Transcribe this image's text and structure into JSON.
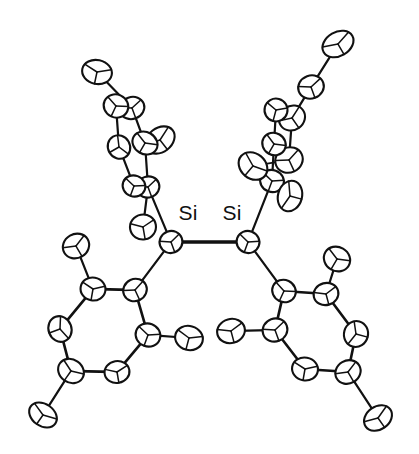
{
  "figure": {
    "kind": "ortep-thermal-ellipsoid-plot",
    "width": 419,
    "height": 454,
    "background_color": "#ffffff",
    "line_color": "#111111",
    "ellipsoid_fill": "#ffffff"
  },
  "labels": [
    {
      "name": "si1-label",
      "text": "Si",
      "x": 188,
      "y": 220,
      "anchor": "middle"
    },
    {
      "name": "si2-label",
      "text": "Si",
      "x": 232,
      "y": 220,
      "anchor": "middle"
    }
  ],
  "atoms": [
    {
      "id": "Si1",
      "element": "Si",
      "x": 171,
      "y": 242,
      "rx": 11.5,
      "ry": 11.0,
      "rot": -20
    },
    {
      "id": "Si2",
      "element": "Si",
      "x": 248,
      "y": 242,
      "rx": 11.5,
      "ry": 11.0,
      "rot": 20
    },
    {
      "id": "C11",
      "element": "C",
      "x": 135,
      "y": 290,
      "rx": 12.0,
      "ry": 11.0,
      "rot": -25
    },
    {
      "id": "C12",
      "element": "C",
      "x": 93,
      "y": 289,
      "rx": 12.5,
      "ry": 11.5,
      "rot": 10
    },
    {
      "id": "C13",
      "element": "C",
      "x": 60,
      "y": 329,
      "rx": 13.0,
      "ry": 11.5,
      "rot": 70
    },
    {
      "id": "C14",
      "element": "C",
      "x": 71,
      "y": 371,
      "rx": 13.5,
      "ry": 11.5,
      "rot": 35
    },
    {
      "id": "C15",
      "element": "C",
      "x": 117,
      "y": 372,
      "rx": 12.5,
      "ry": 11.0,
      "rot": -10
    },
    {
      "id": "C16",
      "element": "C",
      "x": 148,
      "y": 335,
      "rx": 12.5,
      "ry": 11.5,
      "rot": 20
    },
    {
      "id": "C17",
      "element": "C",
      "x": 76,
      "y": 246,
      "rx": 13.5,
      "ry": 12.0,
      "rot": -30
    },
    {
      "id": "C18",
      "element": "C",
      "x": 189,
      "y": 338,
      "rx": 14.0,
      "ry": 12.0,
      "rot": 15
    },
    {
      "id": "C19",
      "element": "C",
      "x": 43,
      "y": 415,
      "rx": 15.0,
      "ry": 11.0,
      "rot": 35
    },
    {
      "id": "C21",
      "element": "C",
      "x": 284,
      "y": 291,
      "rx": 12.0,
      "ry": 11.0,
      "rot": 25
    },
    {
      "id": "C22",
      "element": "C",
      "x": 326,
      "y": 294,
      "rx": 12.5,
      "ry": 11.0,
      "rot": -15
    },
    {
      "id": "C23",
      "element": "C",
      "x": 356,
      "y": 334,
      "rx": 13.0,
      "ry": 12.0,
      "rot": -75
    },
    {
      "id": "C24",
      "element": "C",
      "x": 348,
      "y": 372,
      "rx": 13.0,
      "ry": 11.5,
      "rot": -30
    },
    {
      "id": "C25",
      "element": "C",
      "x": 305,
      "y": 369,
      "rx": 13.0,
      "ry": 11.5,
      "rot": 10
    },
    {
      "id": "C26",
      "element": "C",
      "x": 275,
      "y": 330,
      "rx": 12.5,
      "ry": 11.5,
      "rot": -20
    },
    {
      "id": "C27",
      "element": "C",
      "x": 337,
      "y": 259,
      "rx": 13.5,
      "ry": 12.0,
      "rot": 30
    },
    {
      "id": "C28",
      "element": "C",
      "x": 231,
      "y": 331,
      "rx": 14.0,
      "ry": 12.0,
      "rot": -15
    },
    {
      "id": "C29",
      "element": "C",
      "x": 378,
      "y": 418,
      "rx": 15.0,
      "ry": 11.5,
      "rot": -35
    },
    {
      "id": "C31",
      "element": "C",
      "x": 148,
      "y": 187,
      "rx": 11.5,
      "ry": 10.5,
      "rot": -20
    },
    {
      "id": "C32",
      "element": "C",
      "x": 134,
      "y": 186,
      "rx": 11.5,
      "ry": 10.5,
      "rot": 20
    },
    {
      "id": "C33",
      "element": "C",
      "x": 119,
      "y": 147,
      "rx": 12.0,
      "ry": 11.0,
      "rot": 60
    },
    {
      "id": "C34",
      "element": "C",
      "x": 132,
      "y": 108,
      "rx": 12.5,
      "ry": 11.0,
      "rot": -20
    },
    {
      "id": "C35",
      "element": "C",
      "x": 116,
      "y": 106,
      "rx": 12.5,
      "ry": 11.5,
      "rot": 25
    },
    {
      "id": "C36",
      "element": "C",
      "x": 160,
      "y": 140,
      "rx": 16.0,
      "ry": 12.0,
      "rot": -38
    },
    {
      "id": "C37",
      "element": "C",
      "x": 145,
      "y": 143,
      "rx": 13.0,
      "ry": 11.0,
      "rot": 30
    },
    {
      "id": "C38",
      "element": "C",
      "x": 97,
      "y": 72,
      "rx": 15.0,
      "ry": 12.0,
      "rot": 12
    },
    {
      "id": "C39",
      "element": "C",
      "x": 143,
      "y": 227,
      "rx": 13.0,
      "ry": 12.5,
      "rot": -10
    },
    {
      "id": "C41",
      "element": "C",
      "x": 272,
      "y": 181,
      "rx": 12.0,
      "ry": 11.0,
      "rot": 20
    },
    {
      "id": "C42",
      "element": "C",
      "x": 290,
      "y": 196,
      "rx": 15.5,
      "ry": 12.0,
      "rot": -75
    },
    {
      "id": "C43",
      "element": "C",
      "x": 253,
      "y": 166,
      "rx": 15.5,
      "ry": 12.5,
      "rot": 40
    },
    {
      "id": "C44",
      "element": "C",
      "x": 289,
      "y": 160,
      "rx": 14.0,
      "ry": 12.5,
      "rot": -25
    },
    {
      "id": "C45",
      "element": "C",
      "x": 274,
      "y": 144,
      "rx": 12.0,
      "ry": 11.0,
      "rot": 30
    },
    {
      "id": "C46",
      "element": "C",
      "x": 292,
      "y": 118,
      "rx": 13.5,
      "ry": 12.0,
      "rot": -35
    },
    {
      "id": "C47",
      "element": "C",
      "x": 276,
      "y": 110,
      "rx": 11.5,
      "ry": 11.5,
      "rot": 15
    },
    {
      "id": "C48",
      "element": "C",
      "x": 311,
      "y": 87,
      "rx": 13.0,
      "ry": 11.5,
      "rot": -20
    },
    {
      "id": "C49",
      "element": "C",
      "x": 338,
      "y": 44,
      "rx": 16.5,
      "ry": 12.0,
      "rot": -30
    }
  ],
  "bonds": [
    {
      "from": "Si1",
      "to": "Si2",
      "order": 1,
      "width": 3.4
    },
    {
      "from": "Si1",
      "to": "C11",
      "order": 1,
      "width": 2.2
    },
    {
      "from": "Si1",
      "to": "C31",
      "order": 1,
      "width": 2.2
    },
    {
      "from": "Si2",
      "to": "C21",
      "order": 1,
      "width": 2.2
    },
    {
      "from": "Si2",
      "to": "C41",
      "order": 1,
      "width": 2.2
    },
    {
      "from": "C11",
      "to": "C12",
      "order": 1,
      "width": 2.6
    },
    {
      "from": "C12",
      "to": "C13",
      "order": 1,
      "width": 2.6
    },
    {
      "from": "C13",
      "to": "C14",
      "order": 1,
      "width": 2.6
    },
    {
      "from": "C14",
      "to": "C15",
      "order": 1,
      "width": 2.6
    },
    {
      "from": "C15",
      "to": "C16",
      "order": 1,
      "width": 2.6
    },
    {
      "from": "C16",
      "to": "C11",
      "order": 1,
      "width": 2.6
    },
    {
      "from": "C12",
      "to": "C17",
      "order": 1,
      "width": 2.2
    },
    {
      "from": "C16",
      "to": "C18",
      "order": 1,
      "width": 2.2
    },
    {
      "from": "C14",
      "to": "C19",
      "order": 1,
      "width": 2.2
    },
    {
      "from": "C21",
      "to": "C22",
      "order": 1,
      "width": 2.6
    },
    {
      "from": "C22",
      "to": "C23",
      "order": 1,
      "width": 2.6
    },
    {
      "from": "C23",
      "to": "C24",
      "order": 1,
      "width": 2.6
    },
    {
      "from": "C24",
      "to": "C25",
      "order": 1,
      "width": 2.6
    },
    {
      "from": "C25",
      "to": "C26",
      "order": 1,
      "width": 2.6
    },
    {
      "from": "C26",
      "to": "C21",
      "order": 1,
      "width": 2.6
    },
    {
      "from": "C22",
      "to": "C27",
      "order": 1,
      "width": 2.2
    },
    {
      "from": "C26",
      "to": "C28",
      "order": 1,
      "width": 2.2
    },
    {
      "from": "C24",
      "to": "C29",
      "order": 1,
      "width": 2.2
    },
    {
      "from": "C31",
      "to": "C37",
      "order": 1,
      "width": 2.2
    },
    {
      "from": "C32",
      "to": "C33",
      "order": 1,
      "width": 2.2
    },
    {
      "from": "C33",
      "to": "C35",
      "order": 1,
      "width": 2.2
    },
    {
      "from": "C34",
      "to": "C37",
      "order": 1,
      "width": 2.2
    },
    {
      "from": "C37",
      "to": "C36",
      "order": 1,
      "width": 2.2
    },
    {
      "from": "C34",
      "to": "C38",
      "order": 1,
      "width": 2.2
    },
    {
      "from": "C31",
      "to": "C39",
      "order": 1,
      "width": 2.2
    },
    {
      "from": "C32",
      "to": "C31",
      "order": 1,
      "width": 1.8
    },
    {
      "from": "C34",
      "to": "C35",
      "order": 1,
      "width": 1.8
    },
    {
      "from": "C41",
      "to": "C45",
      "order": 1,
      "width": 2.2
    },
    {
      "from": "C41",
      "to": "C43",
      "order": 1,
      "width": 2.2
    },
    {
      "from": "C41",
      "to": "C42",
      "order": 1,
      "width": 1.8
    },
    {
      "from": "C43",
      "to": "C44",
      "order": 1,
      "width": 1.8
    },
    {
      "from": "C44",
      "to": "C46",
      "order": 1,
      "width": 2.2
    },
    {
      "from": "C45",
      "to": "C47",
      "order": 1,
      "width": 2.2
    },
    {
      "from": "C46",
      "to": "C47",
      "order": 1,
      "width": 1.8
    },
    {
      "from": "C46",
      "to": "C48",
      "order": 1,
      "width": 2.2
    },
    {
      "from": "C48",
      "to": "C49",
      "order": 1,
      "width": 2.2
    }
  ]
}
